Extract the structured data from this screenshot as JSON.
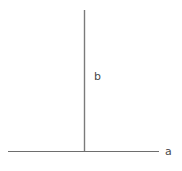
{
  "figure": {
    "title": "",
    "background_color": "#ffffff",
    "width": 182,
    "height": 171
  },
  "labels": {
    "vertical_label": "b",
    "horizontal_label": "a"
  },
  "chart_data": {
    "type": "diagram",
    "title": "",
    "xlabel": "",
    "ylabel": "",
    "elements": [
      {
        "name": "horizontal-line",
        "kind": "segment",
        "label": "a",
        "x1": 8,
        "y1": 151,
        "x2": 159,
        "y2": 151,
        "color": "#6e6e6e",
        "stroke_width": 1
      },
      {
        "name": "vertical-line",
        "kind": "segment",
        "label": "b",
        "x1": 84.5,
        "y1": 10,
        "x2": 84.5,
        "y2": 151,
        "color": "#7a7a7a",
        "stroke_width": 1.4
      }
    ],
    "intersection": {
      "x": 84.5,
      "y": 151
    },
    "colors": {
      "line": "#6e6e6e",
      "text": "#4a4a4a",
      "background": "#ffffff"
    }
  }
}
